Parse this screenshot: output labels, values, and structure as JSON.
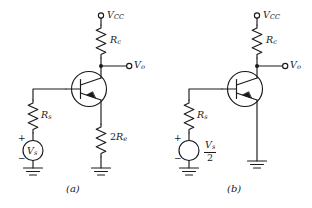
{
  "figure": {
    "line_color": "#1a1a1a",
    "background_color": "#ffffff"
  },
  "circuit_a": {
    "caption": "(a)",
    "supply_label": "V",
    "supply_sub": "CC",
    "collector_resistor_label": "R",
    "collector_resistor_sub": "c",
    "output_label": "V",
    "output_sub": "o",
    "source_resistor_label": "R",
    "source_resistor_sub": "s",
    "source_label": "V",
    "source_sub": "s",
    "emitter_resistor_coefficient": "2",
    "emitter_resistor_label": "R",
    "emitter_resistor_sub": "e",
    "plus_sign": "+",
    "minus_sign": "−",
    "device": "npn-bipolar-junction-transistor"
  },
  "circuit_b": {
    "caption": "(b)",
    "supply_label": "V",
    "supply_sub": "CC",
    "collector_resistor_label": "R",
    "collector_resistor_sub": "c",
    "output_label": "V",
    "output_sub": "o",
    "source_resistor_label": "R",
    "source_resistor_sub": "s",
    "source_numerator_label": "V",
    "source_numerator_sub": "s",
    "source_denominator": "2",
    "plus_sign": "+",
    "minus_sign": "−",
    "device": "npn-bipolar-junction-transistor"
  }
}
